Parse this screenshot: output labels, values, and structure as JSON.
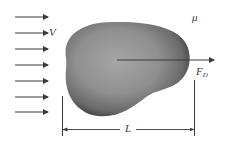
{
  "diagram": {
    "labels": {
      "velocity": "V",
      "viscosity": "μ",
      "drag_force_main": "F",
      "drag_force_sub": "D",
      "length": "L"
    },
    "flow_arrows": {
      "count": 7,
      "y_positions": [
        17,
        33,
        49,
        65,
        81,
        97,
        112
      ],
      "x_start": 15,
      "x_end": 48
    },
    "colors": {
      "background": "#ffffff",
      "line": "#3a3a3a",
      "body_dark": "#4a4a4a",
      "body_mid": "#8c8c8c",
      "body_light": "#a8a8a8"
    }
  }
}
